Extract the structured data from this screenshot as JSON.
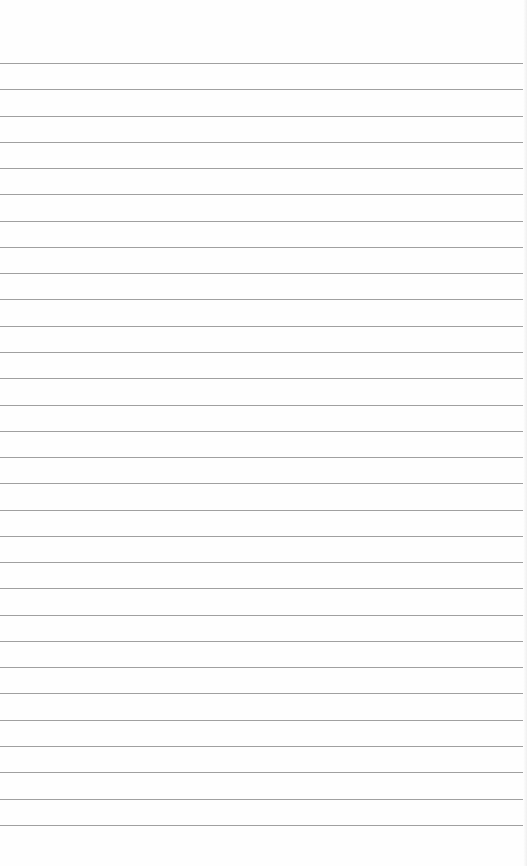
{
  "paper": {
    "type": "lined-paper",
    "background": "#fefefe",
    "line_color": "#8f8f8f",
    "first_line_y": 63,
    "line_spacing": 26.27,
    "line_count": 30
  }
}
